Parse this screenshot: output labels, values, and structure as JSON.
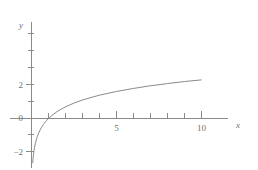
{
  "chart_data": {
    "type": "line",
    "title": "",
    "subtitle": "",
    "xlabel": "x",
    "ylabel": "y",
    "function": "y = ln(x)",
    "xlim": [
      -0.35,
      13.4
    ],
    "ylim": [
      -2.9,
      3.8
    ],
    "xticks": [
      1,
      2,
      3,
      4,
      5,
      6,
      7,
      8,
      9,
      10
    ],
    "yticks": [
      -2,
      -1,
      0,
      1,
      2,
      3
    ],
    "xtick_labels": [
      "",
      "",
      "",
      "",
      "5",
      "",
      "",
      "",
      "",
      "10"
    ],
    "ytick_labels": [
      "−2",
      "",
      "0",
      "",
      "2",
      ""
    ],
    "grid": false,
    "legend": null,
    "series": [
      {
        "name": "ln(x)",
        "color": "#8a8a8a",
        "x": [
          0.07,
          0.08,
          0.09,
          0.1,
          0.12,
          0.15,
          0.18,
          0.22,
          0.26,
          0.3,
          0.35,
          0.4,
          0.5,
          0.6,
          0.7,
          0.8,
          0.9,
          1.0,
          1.2,
          1.5,
          1.8,
          2.0,
          2.5,
          3.0,
          3.5,
          4.0,
          4.5,
          5.0,
          5.5,
          6.0,
          6.5,
          7.0,
          7.5,
          8.0,
          8.5,
          9.0,
          9.5,
          10.0
        ],
        "y": [
          -2.66,
          -2.53,
          -2.41,
          -2.3,
          -2.12,
          -1.9,
          -1.71,
          -1.51,
          -1.35,
          -1.2,
          -1.05,
          -0.92,
          -0.69,
          -0.51,
          -0.36,
          -0.22,
          -0.11,
          0.0,
          0.18,
          0.41,
          0.59,
          0.69,
          0.92,
          1.1,
          1.25,
          1.39,
          1.5,
          1.61,
          1.7,
          1.79,
          1.87,
          1.95,
          2.01,
          2.08,
          2.14,
          2.2,
          2.25,
          2.3
        ]
      }
    ],
    "axis_labels": {
      "x_axis_name": "x",
      "y_axis_name": "y"
    },
    "visible_tick_text": {
      "y_top": "2",
      "y_zero": "0",
      "y_bottom": "−2",
      "x_mid": "5",
      "x_right": "10"
    }
  }
}
